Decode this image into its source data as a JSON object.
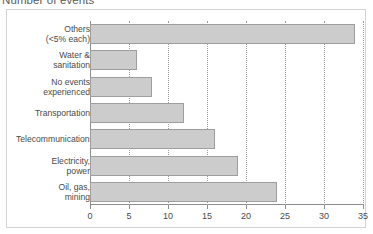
{
  "chart_title": "Number of events",
  "axis": {
    "x_tick_labels": [
      "0",
      "5",
      "10",
      "15",
      "20",
      "25",
      "30",
      "35"
    ],
    "x_tick_values": [
      0,
      5,
      10,
      15,
      20,
      25,
      30,
      35
    ],
    "xmin": 0,
    "xmax": 35
  },
  "colors": {
    "bar_fill": "#cccccc",
    "bar_border": "#9e9e9e",
    "axis": "#8e8e8e",
    "gridline": "#9a9a9a",
    "frame": "#d4d4d4",
    "text": "#4a4a4a"
  },
  "chart_data": {
    "type": "bar",
    "orientation": "horizontal",
    "title": "Number of events",
    "xlabel": "",
    "ylabel": "",
    "xlim": [
      0,
      35
    ],
    "grid": true,
    "legend": false,
    "categories": [
      "Others\n(<5% each)",
      "Water &\nsanitation",
      "No events\nexperienced",
      "Transportation",
      "Telecommunications",
      "Electricity,\npower",
      "Oil, gas,\nmining"
    ],
    "values": [
      34,
      6,
      8,
      12,
      16,
      19,
      24
    ]
  }
}
